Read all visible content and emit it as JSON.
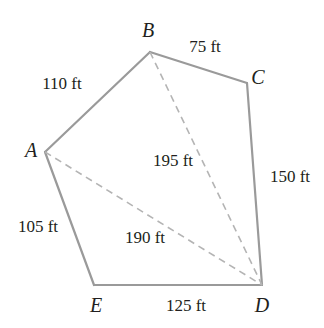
{
  "figure": {
    "type": "polygon-diagram",
    "shape": "pentagon",
    "background_color": "#ffffff",
    "solid_edge_color": "#9a9a9a",
    "dashed_edge_color": "#b0b0b0",
    "text_color": "#221f20",
    "vertices": [
      {
        "id": "A",
        "label": "A",
        "x": 45,
        "y": 152,
        "label_x": 31,
        "label_y": 150
      },
      {
        "id": "B",
        "label": "B",
        "x": 150,
        "y": 52,
        "label_x": 148,
        "label_y": 30
      },
      {
        "id": "C",
        "label": "C",
        "x": 247,
        "y": 83,
        "label_x": 258,
        "label_y": 77
      },
      {
        "id": "D",
        "label": "D",
        "x": 262,
        "y": 285,
        "label_x": 262,
        "label_y": 305
      },
      {
        "id": "E",
        "label": "E",
        "x": 94,
        "y": 285,
        "label_x": 96,
        "label_y": 305
      }
    ],
    "sides": [
      {
        "from": "A",
        "to": "B",
        "length": "110 ft",
        "style": "solid",
        "label_x": 62,
        "label_y": 83
      },
      {
        "from": "B",
        "to": "C",
        "length": "75 ft",
        "style": "solid",
        "label_x": 205,
        "label_y": 46
      },
      {
        "from": "C",
        "to": "D",
        "length": "150 ft",
        "style": "solid",
        "label_x": 290,
        "label_y": 176
      },
      {
        "from": "D",
        "to": "E",
        "length": "125 ft",
        "style": "solid",
        "label_x": 186,
        "label_y": 305
      },
      {
        "from": "E",
        "to": "A",
        "length": "105 ft",
        "style": "solid",
        "label_x": 38,
        "label_y": 226
      }
    ],
    "diagonals": [
      {
        "from": "B",
        "to": "D",
        "length": "195 ft",
        "style": "dashed",
        "label_x": 173,
        "label_y": 160
      },
      {
        "from": "A",
        "to": "D",
        "length": "190 ft",
        "style": "dashed",
        "label_x": 145,
        "label_y": 237
      }
    ],
    "units": "ft"
  }
}
